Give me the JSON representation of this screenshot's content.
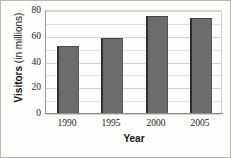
{
  "chart_data": {
    "type": "bar",
    "title": "",
    "categories": [
      "1990",
      "1995",
      "2000",
      "2005"
    ],
    "values": [
      52,
      58,
      75,
      74
    ],
    "series": [
      {
        "name": "Visitors",
        "values": [
          52,
          58,
          75,
          74
        ]
      }
    ],
    "xlabel": "Year",
    "ylabel": "Visitors (in millions)",
    "ylabel_main": "Visitors",
    "ylabel_unit": "(in millions)",
    "ylim": [
      0,
      80
    ],
    "ytick_labels": [
      "80",
      "60",
      "40",
      "20",
      "0"
    ],
    "ytick_values": [
      80,
      60,
      40,
      20,
      0
    ],
    "grid": true,
    "grid_interval": 10,
    "legend": "none",
    "bar_color": "#6d6c6a",
    "bar_edge_color": "#2e2e2d",
    "grid_color": "#e3e1dc",
    "axis_color": "#8e8c88",
    "background_color": "#fdfdfc",
    "text_color": "#1d1c1b"
  }
}
